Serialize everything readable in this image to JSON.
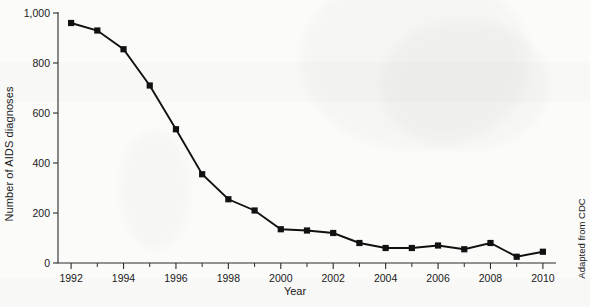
{
  "chart_data": {
    "type": "line",
    "title": "",
    "xlabel": "Year",
    "ylabel": "Number of AIDS diagnoses",
    "credit": "Adapted from CDC",
    "x": [
      1992,
      1993,
      1994,
      1995,
      1996,
      1997,
      1998,
      1999,
      2000,
      2001,
      2002,
      2003,
      2004,
      2005,
      2006,
      2007,
      2008,
      2009,
      2010
    ],
    "values": [
      960,
      930,
      855,
      710,
      535,
      355,
      255,
      210,
      135,
      130,
      120,
      80,
      60,
      60,
      70,
      55,
      80,
      25,
      45
    ],
    "xlim": [
      1991.5,
      2010.5
    ],
    "ylim": [
      0,
      1000
    ],
    "y_ticks": [
      0,
      200,
      400,
      600,
      800,
      1000
    ],
    "y_tick_labels": [
      "0",
      "200",
      "400",
      "600",
      "800",
      "1,000"
    ],
    "x_major_ticks": [
      1992,
      1994,
      1996,
      1998,
      2000,
      2002,
      2004,
      2006,
      2008,
      2010
    ],
    "x_tick_labels": [
      "1992",
      "1994",
      "1996",
      "1998",
      "2000",
      "2002",
      "2004",
      "2006",
      "2008",
      "2010"
    ],
    "x_minor_ticks": [
      1993,
      1995,
      1997,
      1999,
      2001,
      2003,
      2005,
      2007,
      2009
    ],
    "grid": false,
    "legend": null,
    "marker": "square",
    "series_color": "#111111",
    "background_color": "#fbfbfa"
  },
  "figure": {
    "y_axis_title": "Number of AIDS diagnoses",
    "x_axis_title": "Year",
    "credit_text": "Adapted from CDC"
  }
}
